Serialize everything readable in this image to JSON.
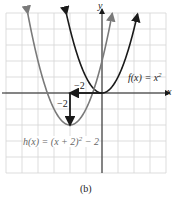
{
  "figure": {
    "caption": "(b)",
    "axes": {
      "x_label": "x",
      "y_label": "y",
      "x_range": [
        -6,
        4
      ],
      "y_range": [
        -5,
        5
      ],
      "grid": true
    },
    "colors": {
      "f_curve": "#1a1a1a",
      "h_curve": "#7a7a7a",
      "grid": "#d4d4d4",
      "axis": "#1a1a1a",
      "arrow": "#1a1a1a"
    },
    "functions": [
      {
        "name": "f",
        "label": "f(x) = x²",
        "label_main": "f(x) = x",
        "label_exp": "2",
        "expression": "x^2",
        "vertex": [
          0,
          0
        ]
      },
      {
        "name": "h",
        "label": "h(x) = (x + 2)² − 2",
        "label_main": "h(x) = (x + 2)",
        "label_exp": "2",
        "label_tail": " − 2",
        "expression": "(x+2)^2-2",
        "vertex": [
          -2,
          -2
        ]
      }
    ],
    "shift_annotations": [
      {
        "direction": "left",
        "label": "−2",
        "from": [
          0,
          0
        ],
        "to": [
          -2,
          0
        ]
      },
      {
        "direction": "down",
        "label": "−2",
        "from": [
          -2,
          0
        ],
        "to": [
          -2,
          -2
        ]
      }
    ]
  }
}
